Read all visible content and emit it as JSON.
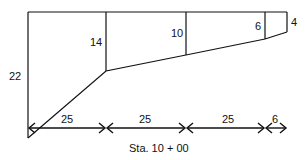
{
  "diagram": {
    "type": "cross-section-profile",
    "heights": [
      {
        "label": "22",
        "x": 28,
        "bottom_y": 138
      },
      {
        "label": "14",
        "x": 106,
        "bottom_y": 71
      },
      {
        "label": "10",
        "x": 186,
        "bottom_y": 55
      },
      {
        "label": "6",
        "x": 265,
        "bottom_y": 39
      },
      {
        "label": "4",
        "x": 287,
        "bottom_y": 32
      }
    ],
    "spacings": [
      {
        "label": "25",
        "x1": 28,
        "x2": 106
      },
      {
        "label": "25",
        "x1": 106,
        "x2": 186
      },
      {
        "label": "25",
        "x1": 186,
        "x2": 265
      },
      {
        "label": "6",
        "x1": 265,
        "x2": 287
      }
    ],
    "station_label": "Sta. 10 + 00",
    "line_color": "#111111"
  }
}
